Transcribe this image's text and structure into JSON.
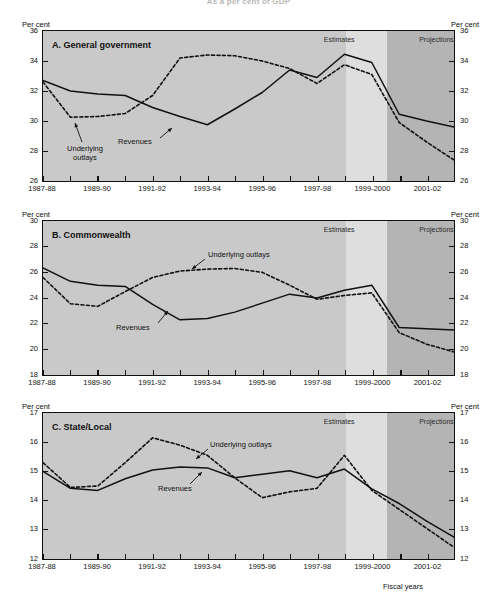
{
  "figure": {
    "title": "As a per cent of GDP",
    "axis_title": "Fiscal years",
    "per_cent_label": "Per cent",
    "band_estimates": "Estimates",
    "band_projections": "Projections",
    "series_names": {
      "revenues": "Revenues",
      "outlays": "Underlying outlays"
    },
    "colors": {
      "plot_background": "#c9c9c9",
      "estimates_band": "#dedede",
      "projections_band": "#b4b4b4",
      "line": "#111111",
      "frame": "#111111"
    }
  },
  "x_tick_labels": [
    "1987-88",
    "1989-90",
    "1991-92",
    "1993-94",
    "1995-96",
    "1997-98",
    "1999-2000",
    "2001-02"
  ],
  "x_categories": [
    "1987-88",
    "1988-89",
    "1989-90",
    "1990-91",
    "1991-92",
    "1992-93",
    "1993-94",
    "1994-95",
    "1995-96",
    "1996-97",
    "1997-98",
    "1998-99",
    "1999-2000",
    "2000-01",
    "2001-02",
    "2002-03"
  ],
  "chart_data": [
    {
      "type": "line",
      "panel_id": "A",
      "title": "A.  General government",
      "ylabel": "Per cent",
      "xlabel": "Fiscal years",
      "ylim": [
        26,
        36
      ],
      "ytick_labels": [
        "26",
        "28",
        "30",
        "32",
        "34",
        "36"
      ],
      "yticks": [
        26,
        28,
        30,
        32,
        34,
        36
      ],
      "grid": false,
      "x": [
        "1987-88",
        "1988-89",
        "1989-90",
        "1990-91",
        "1991-92",
        "1992-93",
        "1993-94",
        "1994-95",
        "1995-96",
        "1996-97",
        "1997-98",
        "1998-99",
        "1999-2000",
        "2000-01",
        "2001-02",
        "2002-03"
      ],
      "series": [
        {
          "name": "Revenues",
          "style": "solid",
          "values": [
            32.7,
            32.0,
            31.8,
            31.7,
            30.9,
            30.3,
            29.75,
            30.8,
            31.9,
            33.4,
            32.9,
            34.45,
            33.9,
            30.45,
            30.0,
            29.6
          ]
        },
        {
          "name": "Underlying outlays",
          "style": "dashed",
          "values": [
            32.6,
            30.25,
            30.3,
            30.5,
            31.7,
            34.2,
            34.4,
            34.35,
            34.0,
            33.5,
            32.5,
            33.75,
            33.1,
            29.9,
            28.6,
            27.4
          ]
        }
      ],
      "band_estimates_label": "Estimates",
      "band_projections_label": "Projections",
      "annotations": [
        {
          "text": "Underlying outlays",
          "for": "Underlying outlays"
        },
        {
          "text": "Revenues",
          "for": "Revenues"
        }
      ]
    },
    {
      "type": "line",
      "panel_id": "B",
      "title": "B.  Commonwealth",
      "ylabel": "Per cent",
      "xlabel": "Fiscal years",
      "ylim": [
        18,
        30
      ],
      "ytick_labels": [
        "18",
        "20",
        "22",
        "24",
        "26",
        "28",
        "30"
      ],
      "yticks": [
        18,
        20,
        22,
        24,
        26,
        28,
        30
      ],
      "grid": false,
      "x": [
        "1987-88",
        "1988-89",
        "1989-90",
        "1990-91",
        "1991-92",
        "1992-93",
        "1993-94",
        "1994-95",
        "1995-96",
        "1996-97",
        "1997-98",
        "1998-99",
        "1999-2000",
        "2000-01",
        "2001-02",
        "2002-03"
      ],
      "series": [
        {
          "name": "Revenues",
          "style": "solid",
          "values": [
            26.35,
            25.3,
            25.0,
            24.9,
            23.5,
            22.3,
            22.4,
            22.9,
            23.6,
            24.3,
            24.0,
            24.6,
            25.0,
            21.7,
            21.6,
            21.5
          ]
        },
        {
          "name": "Underlying outlays",
          "style": "dashed",
          "values": [
            25.6,
            23.55,
            23.35,
            24.5,
            25.6,
            26.1,
            26.25,
            26.3,
            26.0,
            25.0,
            23.9,
            24.2,
            24.4,
            21.3,
            20.4,
            19.8
          ]
        }
      ],
      "band_estimates_label": "Estimates",
      "band_projections_label": "Projections",
      "annotations": [
        {
          "text": "Underlying outlays",
          "for": "Underlying outlays"
        },
        {
          "text": "Revenues",
          "for": "Revenues"
        }
      ]
    },
    {
      "type": "line",
      "panel_id": "C",
      "title": "C.  State/Local",
      "ylabel": "Per cent",
      "xlabel": "Fiscal years",
      "ylim": [
        12,
        17
      ],
      "ytick_labels": [
        "12",
        "13",
        "14",
        "15",
        "16",
        "17"
      ],
      "yticks": [
        12,
        13,
        14,
        15,
        16,
        17
      ],
      "grid": false,
      "x": [
        "1987-88",
        "1988-89",
        "1989-90",
        "1990-91",
        "1991-92",
        "1992-93",
        "1993-94",
        "1994-95",
        "1995-96",
        "1996-97",
        "1997-98",
        "1998-99",
        "1999-2000",
        "2000-01",
        "2001-02",
        "2002-03"
      ],
      "series": [
        {
          "name": "Revenues",
          "style": "solid",
          "values": [
            15.0,
            14.42,
            14.35,
            14.75,
            15.05,
            15.15,
            15.12,
            14.78,
            14.9,
            15.02,
            14.78,
            15.08,
            14.4,
            13.9,
            13.3,
            12.75
          ]
        },
        {
          "name": "Underlying outlays",
          "style": "dashed",
          "values": [
            15.3,
            14.45,
            14.5,
            15.3,
            16.15,
            15.9,
            15.55,
            14.78,
            14.1,
            14.3,
            14.42,
            15.55,
            14.35,
            13.7,
            13.05,
            12.4
          ]
        }
      ],
      "band_estimates_label": "Estimates",
      "band_projections_label": "Projections",
      "annotations": [
        {
          "text": "Underlying outlays",
          "for": "Underlying outlays"
        },
        {
          "text": "Revenues",
          "for": "Revenues"
        }
      ]
    }
  ]
}
